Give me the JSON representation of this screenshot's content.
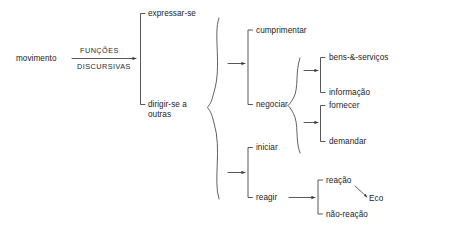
{
  "diagram": {
    "root": {
      "label": "movimento"
    },
    "edge_labels": {
      "above": "FUNÇÕES",
      "below": "DISCURSIVAS"
    },
    "level1": [
      {
        "id": "expressar-se",
        "label": "expressar-se"
      },
      {
        "id": "dirigir-se-a-outras",
        "label": "dirigir-se a outras"
      }
    ],
    "level2_upper": [
      {
        "id": "cumprimentar",
        "label": "cumprimentar"
      },
      {
        "id": "negociar",
        "label": "negociar"
      }
    ],
    "level2_lower": [
      {
        "id": "iniciar",
        "label": "iniciar"
      },
      {
        "id": "reagir",
        "label": "reagir"
      }
    ],
    "level3_negociar_a": [
      {
        "id": "bens-e-servicos",
        "label": "bens-&-serviços"
      },
      {
        "id": "informacao",
        "label": "informação"
      }
    ],
    "level3_negociar_b": [
      {
        "id": "fornecer",
        "label": "fornecer"
      },
      {
        "id": "demandar",
        "label": "demandar"
      }
    ],
    "level3_reagir": [
      {
        "id": "reacao",
        "label": "reação"
      },
      {
        "id": "nao-reacao",
        "label": "não-reação"
      }
    ],
    "annotation": {
      "id": "eco",
      "label": "Eco"
    },
    "colors": {
      "background": "#ffffff",
      "text": "#232323",
      "stroke": "#3a3a3a"
    }
  }
}
